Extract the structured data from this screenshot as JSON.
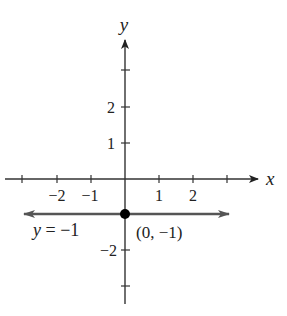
{
  "axes": {
    "x_label": "x",
    "y_label": "y",
    "x_ticks": [
      {
        "value": -3,
        "label": ""
      },
      {
        "value": -2,
        "label": "−2"
      },
      {
        "value": -1,
        "label": "−1"
      },
      {
        "value": 1,
        "label": "1"
      },
      {
        "value": 2,
        "label": "2"
      },
      {
        "value": 3,
        "label": ""
      }
    ],
    "y_ticks": [
      {
        "value": 3,
        "label": ""
      },
      {
        "value": 2,
        "label": "2"
      },
      {
        "value": 1,
        "label": "1"
      },
      {
        "value": -2,
        "label": "−2"
      },
      {
        "value": -3,
        "label": ""
      }
    ]
  },
  "line": {
    "equation_label": "y = −1",
    "y_var": "y",
    "eq_rest": " = −1",
    "color": "#555555"
  },
  "point": {
    "label": "(0, −1)",
    "x": 0,
    "y": -1,
    "color": "#000000"
  },
  "colors": {
    "axis": "#333333",
    "text": "#222222"
  }
}
